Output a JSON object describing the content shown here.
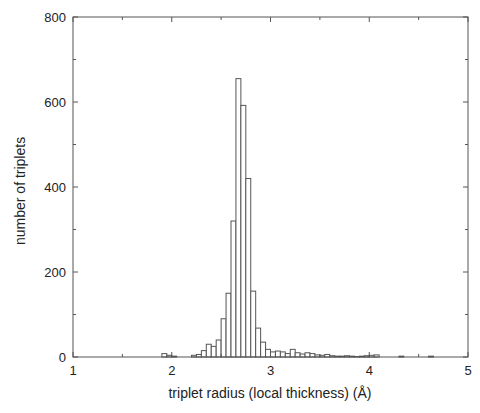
{
  "chart_data": {
    "type": "bar",
    "title": "",
    "xlabel": "triplet radius (local thickness) (Å)",
    "ylabel": "number of triplets",
    "xlim": [
      1,
      5
    ],
    "ylim": [
      0,
      800
    ],
    "xticks": [
      1,
      2,
      3,
      4,
      5
    ],
    "yticks": [
      0,
      200,
      400,
      600,
      800
    ],
    "grid": false,
    "legend": null,
    "bin_width": 0.05,
    "bins": [
      {
        "x": 1.9,
        "value": 8
      },
      {
        "x": 1.95,
        "value": 4
      },
      {
        "x": 2.0,
        "value": 2
      },
      {
        "x": 2.2,
        "value": 4
      },
      {
        "x": 2.25,
        "value": 6
      },
      {
        "x": 2.3,
        "value": 15
      },
      {
        "x": 2.35,
        "value": 30
      },
      {
        "x": 2.4,
        "value": 25
      },
      {
        "x": 2.45,
        "value": 40
      },
      {
        "x": 2.5,
        "value": 90
      },
      {
        "x": 2.55,
        "value": 150
      },
      {
        "x": 2.6,
        "value": 320
      },
      {
        "x": 2.65,
        "value": 655
      },
      {
        "x": 2.7,
        "value": 592
      },
      {
        "x": 2.75,
        "value": 420
      },
      {
        "x": 2.8,
        "value": 155
      },
      {
        "x": 2.85,
        "value": 68
      },
      {
        "x": 2.9,
        "value": 35
      },
      {
        "x": 2.95,
        "value": 18
      },
      {
        "x": 3.0,
        "value": 12
      },
      {
        "x": 3.05,
        "value": 14
      },
      {
        "x": 3.1,
        "value": 12
      },
      {
        "x": 3.15,
        "value": 8
      },
      {
        "x": 3.2,
        "value": 18
      },
      {
        "x": 3.25,
        "value": 10
      },
      {
        "x": 3.3,
        "value": 7
      },
      {
        "x": 3.35,
        "value": 10
      },
      {
        "x": 3.4,
        "value": 8
      },
      {
        "x": 3.45,
        "value": 5
      },
      {
        "x": 3.5,
        "value": 4
      },
      {
        "x": 3.55,
        "value": 6
      },
      {
        "x": 3.6,
        "value": 3
      },
      {
        "x": 3.65,
        "value": 2
      },
      {
        "x": 3.7,
        "value": 2
      },
      {
        "x": 3.75,
        "value": 3
      },
      {
        "x": 3.8,
        "value": 2
      },
      {
        "x": 3.85,
        "value": 1
      },
      {
        "x": 3.9,
        "value": 2
      },
      {
        "x": 3.95,
        "value": 3
      },
      {
        "x": 4.0,
        "value": 4
      },
      {
        "x": 4.05,
        "value": 5
      },
      {
        "x": 4.3,
        "value": 2
      },
      {
        "x": 4.6,
        "value": 2
      }
    ]
  },
  "axes": {
    "xlabel": "triplet radius (local thickness) (Å)",
    "ylabel": "number of triplets"
  }
}
